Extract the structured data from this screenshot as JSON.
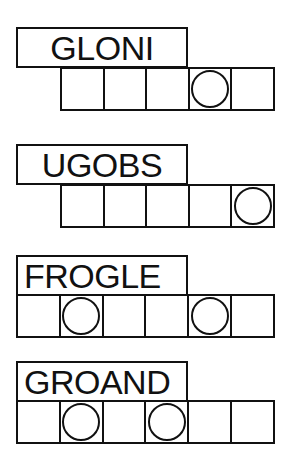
{
  "puzzles": [
    {
      "scrambled": "GLONI",
      "letter_count": 5,
      "circled_positions": [
        4
      ]
    },
    {
      "scrambled": "UGOBS",
      "letter_count": 5,
      "circled_positions": [
        5
      ]
    },
    {
      "scrambled": "FROGLE",
      "letter_count": 6,
      "circled_positions": [
        2,
        5
      ]
    },
    {
      "scrambled": "GROAND",
      "letter_count": 6,
      "circled_positions": [
        2,
        4
      ]
    }
  ],
  "colors": {
    "ink": "#111111",
    "paper": "#ffffff"
  }
}
